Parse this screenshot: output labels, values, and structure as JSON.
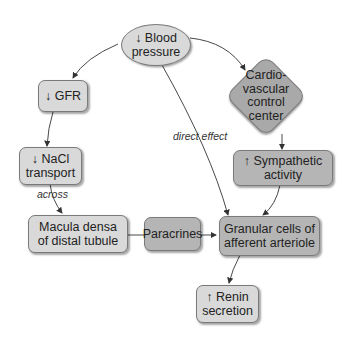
{
  "diagram": {
    "nodes": {
      "blood_pressure": {
        "arrow": "↓",
        "line1": "Blood",
        "line2": "pressure"
      },
      "gfr": {
        "arrow": "↓",
        "line1": "GFR"
      },
      "nacl": {
        "arrow": "↓",
        "line1": "NaCl",
        "line2": "transport"
      },
      "cardio": {
        "line1": "Cardio-",
        "line2": "vascular",
        "line3": "control",
        "line4": "center"
      },
      "sympathetic": {
        "arrow": "↑",
        "line1": "Sympathetic",
        "line2": "activity"
      },
      "macula": {
        "line1": "Macula densa",
        "line2": "of distal tubule"
      },
      "paracrines": {
        "line1": "Paracrines"
      },
      "granular": {
        "line1": "Granular cells of",
        "line2": "afferent arteriole"
      },
      "renin": {
        "arrow": "↑",
        "line1": "Renin",
        "line2": "secretion"
      }
    },
    "edge_labels": {
      "direct_effect": "direct effect",
      "across": "across"
    },
    "colors": {
      "light_node": "#d9d9d9",
      "dark_node": "#b5b5b5",
      "diamond": "#a9a9a9",
      "border": "#7a7a7a",
      "edge": "#333333"
    }
  }
}
